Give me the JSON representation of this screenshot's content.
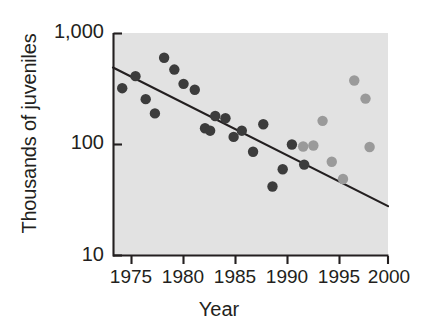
{
  "chart_data": {
    "type": "scatter",
    "title": "",
    "xlabel": "Year",
    "ylabel": "Thousands of juveniles",
    "xlim": [
      1973.4,
      2000.3
    ],
    "ylim": [
      10,
      1000
    ],
    "yscale": "log",
    "grid": false,
    "legend": "none",
    "xticks": [
      1975,
      1980,
      1985,
      1990,
      1995,
      2000
    ],
    "xtick_labels": [
      "1975",
      "1980",
      "1985",
      "1990",
      "1995",
      "2000"
    ],
    "yticks": [
      10,
      100,
      1000
    ],
    "ytick_labels": [
      "10",
      "100",
      "1,000"
    ],
    "series": [
      {
        "name": "dark-points",
        "color": "#3c3c3c",
        "points": [
          {
            "x": 1974.3,
            "y": 320
          },
          {
            "x": 1975.6,
            "y": 410
          },
          {
            "x": 1976.6,
            "y": 255
          },
          {
            "x": 1977.5,
            "y": 190
          },
          {
            "x": 1978.4,
            "y": 600
          },
          {
            "x": 1979.4,
            "y": 470
          },
          {
            "x": 1980.3,
            "y": 350
          },
          {
            "x": 1981.4,
            "y": 310
          },
          {
            "x": 1982.4,
            "y": 140
          },
          {
            "x": 1982.9,
            "y": 133
          },
          {
            "x": 1983.4,
            "y": 180
          },
          {
            "x": 1984.4,
            "y": 172
          },
          {
            "x": 1985.2,
            "y": 117
          },
          {
            "x": 1986.0,
            "y": 133
          },
          {
            "x": 1987.1,
            "y": 86
          },
          {
            "x": 1988.1,
            "y": 152
          },
          {
            "x": 1989.0,
            "y": 42
          },
          {
            "x": 1990.0,
            "y": 60
          },
          {
            "x": 1990.9,
            "y": 100
          },
          {
            "x": 1992.1,
            "y": 66
          }
        ]
      },
      {
        "name": "light-points",
        "color": "#9a9a9a",
        "points": [
          {
            "x": 1992.0,
            "y": 96
          },
          {
            "x": 1993.0,
            "y": 98
          },
          {
            "x": 1993.9,
            "y": 163
          },
          {
            "x": 1994.8,
            "y": 70
          },
          {
            "x": 1995.9,
            "y": 49
          },
          {
            "x": 1997.0,
            "y": 375
          },
          {
            "x": 1998.1,
            "y": 258
          },
          {
            "x": 1998.5,
            "y": 95
          }
        ]
      }
    ],
    "trendline": {
      "name": "regression-line",
      "color": "#231f20",
      "x_start": 1973.4,
      "y_start": 490,
      "x_end": 2000.3,
      "y_end": 28
    }
  },
  "axes": {
    "y_label": "Thousands of juveniles",
    "x_label": "Year",
    "y_tick_labels": [
      "1,000",
      "100",
      "10"
    ],
    "x_tick_labels": [
      "1975",
      "1980",
      "1985",
      "1990",
      "1995",
      "2000"
    ]
  },
  "colors": {
    "plot_background": "#e6e6e6",
    "axis": "#231f20",
    "dark_marker": "#3c3c3c",
    "light_marker": "#9a9a9a",
    "text": "#231f20",
    "page_background": "#ffffff"
  }
}
